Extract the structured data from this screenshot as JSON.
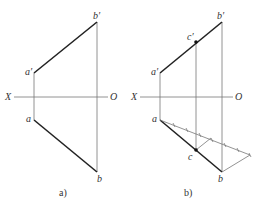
{
  "figures": [
    {
      "caption": "a)",
      "labels": {
        "a_prime": "a′",
        "b_prime": "b′",
        "a": "a",
        "b": "b",
        "x_axis": "X",
        "origin": "O"
      }
    },
    {
      "caption": "b)",
      "labels": {
        "a_prime": "a′",
        "b_prime": "b′",
        "c_prime": "c′",
        "a": "a",
        "b": "b",
        "c": "c",
        "x_axis": "X",
        "origin": "O"
      },
      "ruler_divisions": 7
    }
  ],
  "colors": {
    "line": "#3a3a3a",
    "thick_line": "#222222",
    "thin_line": "#777777"
  }
}
